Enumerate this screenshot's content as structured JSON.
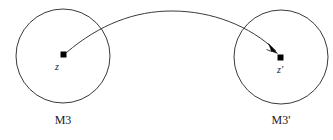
{
  "figure": {
    "kind": "mapping-diagram",
    "background_color": "#ffffff",
    "stroke_color": "#3a3a3a",
    "marker_color": "#000000",
    "width": 333,
    "height": 140
  },
  "source": {
    "region_label": "M3",
    "point_label": "z",
    "center_x": 63,
    "center_y": 56,
    "radius": 47,
    "point_x": 63.5,
    "point_y": 54.5,
    "point_label_x": 57,
    "point_label_y": 70,
    "region_label_x": 63,
    "region_label_y": 124
  },
  "target": {
    "region_label": "M3'",
    "point_label": "z'",
    "center_x": 281,
    "center_y": 57,
    "radius": 47,
    "point_x": 280.5,
    "point_y": 57.5,
    "point_label_x": 280,
    "point_label_y": 73,
    "region_label_x": 281,
    "region_label_y": 124
  },
  "mapping_arrow": {
    "name": "mapping-curve",
    "path": "M 66.5 52.5 C 100 24 135 11 172 11 C 212 11 250 26 275.5 50.5",
    "arrowhead_points": "277.5,53.5 268.5,43.5 271.5,51.5 266.5,49.5",
    "description": "curved arrow from z to z prime"
  }
}
